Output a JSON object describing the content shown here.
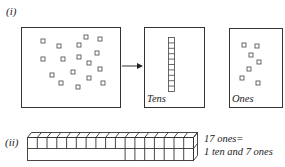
{
  "part_i": {
    "label": "(i)",
    "loose_panel": {
      "square_count": 17
    },
    "arrow": "right-arrow",
    "tens_panel": {
      "label": "Tens",
      "rod_cells": 10
    },
    "ones_panel": {
      "label": "Ones",
      "square_count": 7
    }
  },
  "part_ii": {
    "label": "(ii)",
    "rod": {
      "total_cells": 17,
      "tens_grouped": 10,
      "ones": 7
    },
    "caption_line1": "17 ones=",
    "caption_line2": "1 ten and 7 ones"
  },
  "colors": {
    "line": "#333333",
    "background": "#ffffff"
  }
}
